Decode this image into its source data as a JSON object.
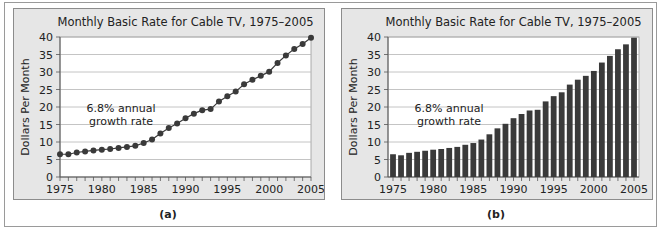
{
  "chart_data": [
    {
      "id": "a",
      "type": "line",
      "title": "Monthly Basic Rate for Cable TV, 1975–2005",
      "xlabel": "",
      "ylabel": "Dollars Per Month",
      "caption": "(a)",
      "annotation": [
        "6.8% annual",
        "growth rate"
      ],
      "xlim": [
        1975,
        2005
      ],
      "ylim": [
        0,
        40
      ],
      "xticks": [
        1975,
        1980,
        1985,
        1990,
        1995,
        2000,
        2005
      ],
      "yticks": [
        0,
        5,
        10,
        15,
        20,
        25,
        30,
        35,
        40
      ],
      "grid": true,
      "markers": true,
      "x": [
        1975,
        1976,
        1977,
        1978,
        1979,
        1980,
        1981,
        1982,
        1983,
        1984,
        1985,
        1986,
        1987,
        1988,
        1989,
        1990,
        1991,
        1992,
        1993,
        1994,
        1995,
        1996,
        1997,
        1998,
        1999,
        2000,
        2001,
        2002,
        2003,
        2004,
        2005
      ],
      "y": [
        6.5,
        6.5,
        7.0,
        7.3,
        7.6,
        7.8,
        8.0,
        8.3,
        8.6,
        8.9,
        9.7,
        10.7,
        12.4,
        14.0,
        15.3,
        16.8,
        18.1,
        19.1,
        19.4,
        21.6,
        23.1,
        24.4,
        26.5,
        27.8,
        28.9,
        30.1,
        32.6,
        34.7,
        36.6,
        38.0,
        39.8
      ]
    },
    {
      "id": "b",
      "type": "bar",
      "title": "Monthly Basic Rate for Cable TV, 1975–2005",
      "xlabel": "",
      "ylabel": "Dollars Per Month",
      "caption": "(b)",
      "annotation": [
        "6.8% annual",
        "growth rate"
      ],
      "xlim": [
        1975,
        2005
      ],
      "ylim": [
        0,
        40
      ],
      "xticks": [
        1975,
        1980,
        1985,
        1990,
        1995,
        2000,
        2005
      ],
      "yticks": [
        0,
        5,
        10,
        15,
        20,
        25,
        30,
        35,
        40
      ],
      "grid": true,
      "x": [
        1975,
        1976,
        1977,
        1978,
        1979,
        1980,
        1981,
        1982,
        1983,
        1984,
        1985,
        1986,
        1987,
        1988,
        1989,
        1990,
        1991,
        1992,
        1993,
        1994,
        1995,
        1996,
        1997,
        1998,
        1999,
        2000,
        2001,
        2002,
        2003,
        2004,
        2005
      ],
      "y": [
        6.5,
        6.2,
        6.9,
        7.2,
        7.5,
        7.8,
        8.0,
        8.3,
        8.6,
        9.2,
        9.7,
        10.7,
        12.2,
        13.9,
        15.2,
        16.8,
        18.0,
        19.0,
        19.2,
        21.6,
        23.1,
        24.2,
        26.4,
        27.8,
        28.9,
        30.3,
        32.7,
        34.6,
        36.5,
        37.9,
        39.8
      ]
    }
  ],
  "colors": {
    "panel_bg": "#e6e6e6",
    "plot_bg": "#ffffff",
    "grid": "#b5b5b5",
    "mark": "#3a3a3a",
    "text": "#222222"
  }
}
